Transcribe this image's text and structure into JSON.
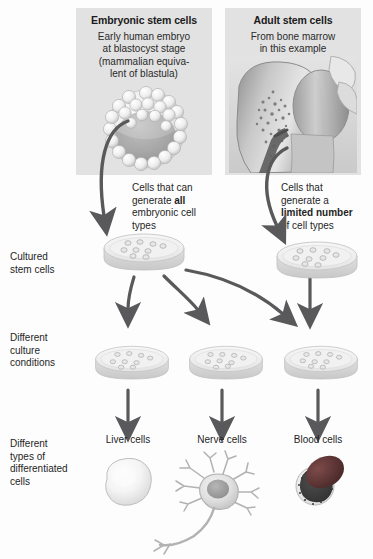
{
  "figure": {
    "width": 373,
    "height": 559
  },
  "panels": [
    {
      "id": "embryonic",
      "title": "Embryonic stem cells",
      "subtitle": "Early human embryo at blastocyst stage (mammalian equivalent of blastula)",
      "subtitle_lines": [
        "Early human embryo",
        "at blastocyst stage",
        "(mammalian equiva-",
        "lent of blastula)"
      ],
      "illustration": "blastocyst-illustration"
    },
    {
      "id": "adult",
      "title": "Adult stem cells",
      "subtitle": "From bone marrow in this example",
      "subtitle_lines": [
        "From bone marrow",
        "in this example"
      ],
      "illustration": "bone-marrow-illustration"
    }
  ],
  "captions": [
    {
      "id": "embryonic-potency",
      "lines": [
        "Cells that can",
        "generate all",
        "embryonic cell",
        "types"
      ],
      "emphasis": "all",
      "full_text": "Cells that can generate all embryonic cell types"
    },
    {
      "id": "adult-potency",
      "lines": [
        "Cells that",
        "generate a",
        "limited number",
        "of cell types"
      ],
      "emphasis": "limited number",
      "full_text": "Cells that generate a limited number of cell types"
    }
  ],
  "row_labels": [
    {
      "id": "cultured-stem-cells",
      "lines": [
        "Cultured",
        "stem cells"
      ],
      "full_text": "Cultured stem cells"
    },
    {
      "id": "different-culture-conditions",
      "lines": [
        "Different",
        "culture",
        "conditions"
      ],
      "full_text": "Different culture conditions"
    },
    {
      "id": "different-types-differentiated-cells",
      "lines": [
        "Different",
        "types of",
        "differentiated",
        "cells"
      ],
      "full_text": "Different types of differentiated cells"
    }
  ],
  "cultured_dishes": [
    {
      "id": "dish-embryonic",
      "cell_count": 9
    },
    {
      "id": "dish-adult",
      "cell_count": 9
    }
  ],
  "condition_dishes": [
    {
      "id": "dish-liver",
      "cell_count": 9
    },
    {
      "id": "dish-nerve",
      "cell_count": 9
    },
    {
      "id": "dish-blood",
      "cell_count": 9
    }
  ],
  "differentiated_cells": [
    {
      "id": "liver-cells",
      "label": "Liver cells",
      "illustration": "liver-cell-illustration"
    },
    {
      "id": "nerve-cells",
      "label": "Nerve cells",
      "illustration": "neuron-illustration"
    },
    {
      "id": "blood-cells",
      "label": "Blood cells",
      "illustration": "blood-cells-illustration"
    }
  ],
  "colors": {
    "panel_background": "#e2e2e2",
    "arrow": "#59595b",
    "text": "#1f1f1f",
    "dish_fill": "#efefef",
    "dish_rim": "#d4d4d4",
    "blood_red": "#6f3f3f",
    "page_background": "#ffffff"
  }
}
